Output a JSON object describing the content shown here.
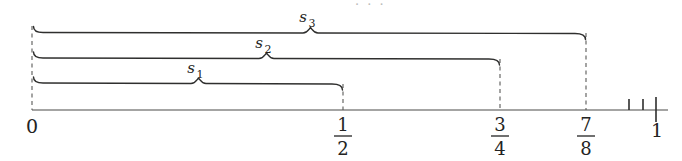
{
  "figure": {
    "title": "",
    "ellipsis": "· · ·",
    "axis": {
      "start_label": "0",
      "end_label": "1",
      "ticks": [
        {
          "name": "zero",
          "label_type": "integer",
          "label": "0",
          "x": 32
        },
        {
          "name": "one-half",
          "label_type": "fraction",
          "numerator": "1",
          "denominator": "2",
          "x": 343
        },
        {
          "name": "three-quarters",
          "label_type": "fraction",
          "numerator": "3",
          "denominator": "4",
          "x": 500
        },
        {
          "name": "seven-eighths",
          "label_type": "fraction",
          "numerator": "7",
          "denominator": "8",
          "x": 586
        },
        {
          "name": "unlabeled-1",
          "label_type": "none",
          "label": "",
          "x": 629
        },
        {
          "name": "unlabeled-2",
          "label_type": "none",
          "label": "",
          "x": 643
        },
        {
          "name": "one",
          "label_type": "integer",
          "label": "1",
          "x": 656
        }
      ]
    },
    "braces": [
      {
        "name": "brace-s1",
        "label": "s",
        "subscript": "1",
        "from_label": "0",
        "to_label": "1/2",
        "x_start": 33,
        "x_end": 343,
        "y": 82,
        "label_x": 198,
        "label_y": 72
      },
      {
        "name": "brace-s2",
        "label": "s",
        "subscript": "2",
        "from_label": "0",
        "to_label": "3/4",
        "x_start": 33,
        "x_end": 500,
        "y": 57,
        "label_x": 266,
        "label_y": 47
      },
      {
        "name": "brace-s3",
        "label": "s",
        "subscript": "3",
        "from_label": "0",
        "to_label": "7/8",
        "x_start": 33,
        "x_end": 586,
        "y": 31,
        "label_x": 310,
        "label_y": 21
      }
    ],
    "colors": {
      "ink": "#2f2f2e",
      "axis": "#4a4a49",
      "dash": "#5a5a58",
      "background": "#ffffff",
      "faint": "#b9b9b7"
    }
  }
}
